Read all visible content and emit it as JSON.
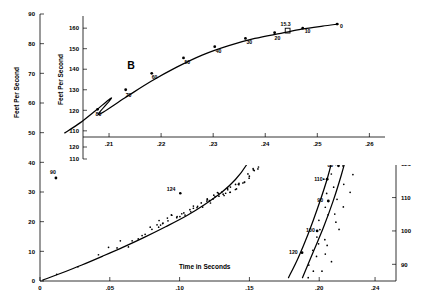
{
  "chart_data": {
    "type": "line",
    "title": "",
    "xlabel": "Time in Seconds",
    "ylabel_left": "Feet Per Second",
    "ylabel_right": "",
    "axes": {
      "x": {
        "min": 0.0,
        "max": 0.255,
        "ticks": [
          0,
          0.05,
          0.1,
          0.15,
          0.2,
          0.24
        ],
        "tick_labels": [
          "0",
          ".05",
          ".10",
          ".15",
          ".20",
          ".24"
        ]
      },
      "y_left": {
        "min": 0,
        "max": 90,
        "ticks": [
          0,
          10,
          20,
          30,
          40,
          50,
          60,
          70,
          80,
          90
        ],
        "tick_labels": [
          "0",
          "10",
          "20",
          "30",
          "40",
          "50",
          "60",
          "70",
          "80",
          "90"
        ]
      },
      "y_right": {
        "min": 85,
        "max": 165,
        "ticks": [
          90,
          100,
          110,
          120,
          130,
          140,
          150,
          165
        ],
        "tick_labels": [
          "90",
          "100",
          "110",
          "120",
          "130",
          "140",
          "150",
          "165"
        ]
      }
    },
    "series": [
      {
        "name": "A-lower",
        "label": "A",
        "axis": "left",
        "point_labels": [
          "124"
        ],
        "x": [
          0.002,
          0.015,
          0.03,
          0.045,
          0.06,
          0.075,
          0.09,
          0.105,
          0.118,
          0.13,
          0.14,
          0.148,
          0.155
        ],
        "y": [
          0.3,
          2.6,
          5.4,
          8.4,
          11.5,
          14.8,
          18.3,
          22.0,
          25.8,
          29.8,
          34.2,
          39.2,
          45.5
        ]
      },
      {
        "name": "A-upper",
        "label": "A",
        "axis": "right",
        "point_labels": [
          "110",
          "120"
        ],
        "x": [
          0.178,
          0.185,
          0.192,
          0.199,
          0.206,
          0.212,
          0.218,
          0.224
        ],
        "y": [
          86,
          92,
          99,
          107,
          116,
          126,
          138,
          152
        ]
      },
      {
        "name": "A-right",
        "label": "A",
        "axis": "right",
        "point_labels": [
          "100",
          "90",
          "80",
          "70",
          "60",
          "50",
          "40",
          "30"
        ],
        "x": [
          0.188,
          0.196,
          0.203,
          0.21,
          0.216,
          0.222,
          0.228,
          0.234,
          0.24,
          0.245,
          0.249
        ],
        "y": [
          86,
          94,
          101,
          109,
          117,
          126,
          135,
          143,
          150,
          155,
          157
        ]
      },
      {
        "name": "B-inset",
        "label": "B",
        "axis": "inset",
        "point_labels": [
          "80",
          "70",
          "60",
          "50",
          "40",
          "30",
          "20",
          "15.3",
          "10",
          "0"
        ],
        "x": [
          0.208,
          0.213,
          0.218,
          0.223,
          0.228,
          0.233,
          0.238,
          0.243,
          0.247,
          0.251,
          0.254
        ],
        "y": [
          118,
          126,
          134,
          141,
          147,
          151.5,
          155,
          157.5,
          159.5,
          161,
          162
        ]
      }
    ],
    "inset": {
      "xlabel": "",
      "ylabel": "Feet Per Second",
      "x_ticks": [
        0.21,
        0.22,
        0.23,
        0.24,
        0.25,
        0.26
      ],
      "x_tick_labels": [
        ".21",
        ".22",
        ".23",
        ".24",
        ".25",
        ".26"
      ],
      "y_ticks": [
        110,
        120,
        130,
        140,
        150,
        160
      ],
      "y_tick_labels": [
        "110",
        "120",
        "130",
        "140",
        "150",
        "160"
      ],
      "curve_label": "B",
      "point_labels": [
        "90",
        "80",
        "70",
        "60",
        "50",
        "40",
        "30",
        "20",
        "15.3",
        "10",
        "0"
      ]
    },
    "annotations": [
      {
        "text": "A",
        "role": "curve-label-lower"
      },
      {
        "text": "A",
        "role": "curve-label-right"
      },
      {
        "text": "B",
        "role": "inset-curve-label"
      },
      {
        "text": "124",
        "role": "point-label"
      },
      {
        "text": "110",
        "role": "point-label"
      },
      {
        "text": "120",
        "role": "point-label"
      },
      {
        "text": "100",
        "role": "point-label"
      },
      {
        "text": "90",
        "role": "point-label"
      },
      {
        "text": "80",
        "role": "point-label"
      },
      {
        "text": "15.3",
        "role": "point-label"
      }
    ],
    "scatter": {
      "note": "measured data points around curve A",
      "x": [
        0.012,
        0.028,
        0.042,
        0.05,
        0.055,
        0.058,
        0.063,
        0.066,
        0.07,
        0.073,
        0.076,
        0.078,
        0.081,
        0.084,
        0.086,
        0.088,
        0.092,
        0.095,
        0.098,
        0.101,
        0.104,
        0.107,
        0.11,
        0.113,
        0.116,
        0.119,
        0.122,
        0.125,
        0.128,
        0.131,
        0.134,
        0.137,
        0.14,
        0.143,
        0.146,
        0.15,
        0.153,
        0.157,
        0.161,
        0.164
      ],
      "y": [
        1.8,
        5.0,
        8.5,
        10.2,
        11.0,
        12.6,
        12.1,
        13.8,
        14.6,
        15.0,
        16.4,
        16.8,
        17.2,
        18.5,
        19.0,
        19.6,
        20.3,
        21.0,
        21.6,
        22.0,
        22.8,
        23.4,
        24.2,
        25.0,
        25.4,
        26.3,
        27.0,
        27.6,
        28.4,
        29.0,
        30.0,
        30.6,
        31.5,
        32.6,
        33.8,
        35.2,
        36.6,
        38.4,
        40.5,
        43.0
      ]
    }
  },
  "labels": {
    "x_axis": "Time in Seconds",
    "y_axis_left": "Feet Per Second",
    "y_axis_inset": "Feet Per Second"
  }
}
